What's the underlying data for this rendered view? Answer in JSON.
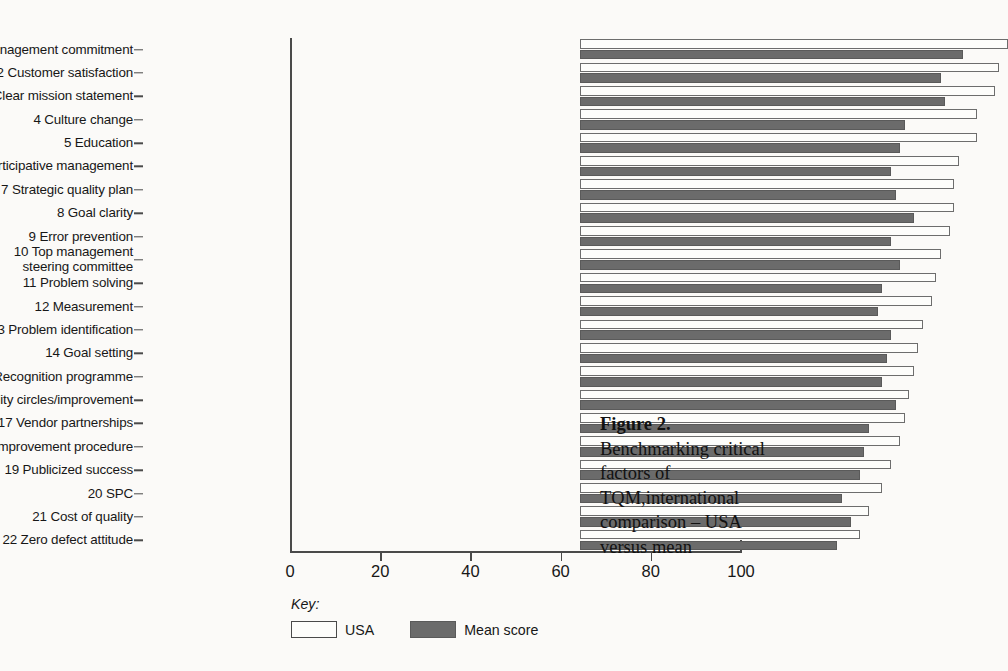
{
  "figure": {
    "caption_title": "Figure 2.",
    "caption_body": "Benchmarking critical factors of TQM,international comparison – USA versus mean"
  },
  "legend": {
    "title": "Key:",
    "items": [
      {
        "label": "USA",
        "swatch": "white-swatch",
        "color": "#fdfdfb"
      },
      {
        "label": "Mean score",
        "swatch": "gray-swatch",
        "color": "#6b6b6b"
      }
    ]
  },
  "axis": {
    "x_ticks": [
      0,
      20,
      40,
      60,
      80,
      100
    ],
    "x_tick_labels": [
      "0",
      "20",
      "40",
      "60",
      "80",
      "100"
    ]
  },
  "chart_data": {
    "type": "bar",
    "orientation": "horizontal",
    "title": "Benchmarking critical factors of TQM,international comparison – USA versus mean",
    "xlabel": "",
    "ylabel": "",
    "xlim": [
      0,
      100
    ],
    "grid": false,
    "legend_position": "bottom-left",
    "categories": [
      "1 Management commitment",
      "2 Customer satisfaction",
      "3 Clear mission statement",
      "4 Culture change",
      "5 Education",
      "6 Participative management",
      "7 Strategic quality plan",
      "8 Goal clarity",
      "9 Error prevention",
      "10 Top management\nsteering committee",
      "11 Problem solving",
      "12 Measurement",
      "13 Problem identification",
      "14 Goal setting",
      "15 Recognition programme",
      "16 Quality circles/improvement",
      "17 Vendor partnerships",
      "18 Project improvement procedure",
      "19 Publicized success",
      "20 SPC",
      "21 Cost of quality",
      "22 Zero defect attitude"
    ],
    "series": [
      {
        "name": "USA",
        "color": "#fdfdfb",
        "values": [
          95,
          93,
          92,
          88,
          88,
          84,
          83,
          83,
          82,
          80,
          79,
          78,
          76,
          75,
          74,
          73,
          72,
          71,
          69,
          67,
          64,
          62
        ]
      },
      {
        "name": "Mean score",
        "color": "#6b6b6b",
        "values": [
          85,
          80,
          81,
          72,
          71,
          69,
          70,
          74,
          69,
          71,
          67,
          66,
          69,
          68,
          67,
          70,
          64,
          63,
          62,
          58,
          60,
          57
        ]
      }
    ]
  }
}
